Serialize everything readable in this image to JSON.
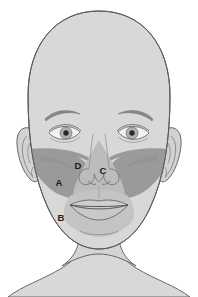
{
  "diagram": {
    "type": "anatomical-line-drawing",
    "view": "anterior frontal face",
    "background_color": "#ffffff",
    "colors": {
      "skin_fill": "#d8d8d8",
      "skin_outline": "#5a5a5a",
      "shade_light": "#bdbdbd",
      "shade_mid": "#adadad",
      "shade_dark": "#8f8f8f",
      "feature_line": "#6e6e6e",
      "iris": "#b0b0b0",
      "pupil": "#2a2a2a",
      "sclera": "#f2f2f2",
      "label_text": "#1b1b1b"
    },
    "labels": [
      {
        "id": "label-a",
        "text": "A",
        "x": 59,
        "y": 183,
        "region": "left-mid-cheek-dark-band"
      },
      {
        "id": "label-b",
        "text": "B",
        "x": 61,
        "y": 218,
        "region": "left-lower-jaw-light"
      },
      {
        "id": "label-c",
        "text": "C",
        "x": 103,
        "y": 171,
        "region": "nose-tip-center"
      },
      {
        "id": "label-d",
        "text": "D",
        "x": 78,
        "y": 166,
        "region": "left-nasal-sidewall-light"
      }
    ],
    "features": [
      {
        "name": "head-outline",
        "interactable": false
      },
      {
        "name": "left-ear",
        "interactable": false
      },
      {
        "name": "right-ear",
        "interactable": false
      },
      {
        "name": "left-eyebrow",
        "interactable": false
      },
      {
        "name": "right-eyebrow",
        "interactable": false
      },
      {
        "name": "left-eye",
        "interactable": false
      },
      {
        "name": "right-eye",
        "interactable": false
      },
      {
        "name": "nose",
        "interactable": false
      },
      {
        "name": "mouth",
        "interactable": false
      },
      {
        "name": "chin-crease",
        "interactable": false
      },
      {
        "name": "neck",
        "interactable": false
      },
      {
        "name": "shoulders",
        "interactable": false
      }
    ],
    "shaded_zones": [
      {
        "name": "maxillary-dark-band",
        "tone": "dark",
        "description": "wide darker band across both cheeks below the eyes extending to the ears"
      },
      {
        "name": "central-light-triangle",
        "tone": "light",
        "description": "lighter triangular zone around nose and upper lip"
      },
      {
        "name": "lower-light-zone",
        "tone": "light",
        "description": "lighter zone over mouth and lower jaw"
      }
    ]
  }
}
